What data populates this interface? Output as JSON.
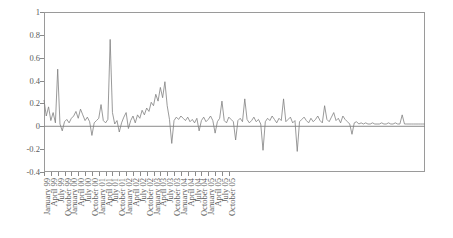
{
  "chart_data": {
    "type": "line",
    "title": "",
    "xlabel": "",
    "ylabel": "",
    "ylim": [
      -0.4,
      1
    ],
    "yticks": [
      1,
      0.8,
      0.6,
      0.4,
      0.2,
      0,
      -0.2,
      -0.4
    ],
    "ytick_labels": [
      "1",
      "0.8",
      "0.6",
      "0.4",
      "0.2",
      "0",
      "-0.2",
      "-0.4"
    ],
    "grid": false,
    "legend": "none",
    "line_color": "#808080",
    "zero_line": true,
    "xtick_labels": [
      "January 99",
      "April 99",
      "July 99",
      "October 99",
      "January 00",
      "April 00",
      "July 00",
      "October 00",
      "January 01",
      "April 01",
      "July 01",
      "October 01",
      "January 02",
      "April 02",
      "July 02",
      "October 02",
      "January 03",
      "April 03",
      "July 03",
      "October 03",
      "January 04",
      "April 04",
      "July 04",
      "October 04",
      "January 05",
      "April 05",
      "July 05",
      "October 05"
    ],
    "x_start": "January 99",
    "x_end": "December 05",
    "x_frequency": "monthly",
    "xtick_frequency": "quarterly",
    "series": [
      {
        "name": "series-1",
        "values": [
          0.23,
          0.09,
          0.17,
          0.05,
          0.12,
          0.03,
          0.5,
          0.02,
          -0.04,
          0.04,
          0.06,
          0.03,
          0.07,
          0.09,
          0.13,
          0.07,
          0.15,
          0.1,
          0.05,
          0.08,
          0.04,
          -0.08,
          0.03,
          0.05,
          0.07,
          0.19,
          0.05,
          0.03,
          0.06,
          0.76,
          0.12,
          0.02,
          0.05,
          -0.05,
          0.03,
          0.08,
          0.12,
          -0.02,
          0.05,
          0.09,
          0.03,
          0.1,
          0.07,
          0.14,
          0.1,
          0.16,
          0.13,
          0.21,
          0.18,
          0.28,
          0.22,
          0.34,
          0.25,
          0.39,
          0.18,
          0.06,
          -0.15,
          0.05,
          0.08,
          0.06,
          0.09,
          0.07,
          0.05,
          0.08,
          0.04,
          0.06,
          0.03,
          0.07,
          -0.04,
          0.05,
          0.08,
          0.04,
          0.06,
          0.09,
          0.05,
          -0.06,
          0.04,
          0.07,
          0.22,
          0.05,
          0.03,
          0.08,
          0.06,
          0.04,
          -0.12,
          0.05,
          0.07,
          0.04,
          0.24,
          0.06,
          0.03,
          0.05,
          0.08,
          0.04,
          0.06,
          0.02,
          -0.21,
          0.04,
          0.07,
          0.05,
          0.09,
          0.06,
          0.03,
          0.07,
          0.05,
          0.24,
          0.04,
          0.06,
          0.08,
          0.03,
          0.05,
          -0.22,
          0.04,
          0.06,
          0.08,
          0.05,
          0.03,
          0.07,
          0.04,
          0.06,
          0.09,
          0.05,
          0.03,
          0.18,
          0.06,
          0.04,
          0.08,
          0.12,
          0.05,
          0.07,
          0.03,
          0.09,
          0.06,
          0.04,
          0.02,
          -0.07,
          0.03,
          0.04,
          0.02,
          0.03,
          0.02,
          0.03,
          0.02,
          0.02,
          0.03,
          0.02,
          0.02,
          0.02,
          0.03,
          0.02,
          0.02,
          0.03,
          0.02,
          0.02,
          0.03,
          0.02,
          0.02,
          0.1,
          0.02,
          0.02,
          0.02,
          0.02,
          0.02,
          0.02,
          0.02,
          0.02,
          0.02,
          0.02
        ]
      }
    ]
  }
}
